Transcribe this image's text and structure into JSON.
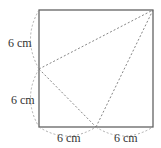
{
  "diagram": {
    "shape": "square",
    "labels": {
      "left_top": "6 cm",
      "left_bottom": "6 cm",
      "bottom_left": "6 cm",
      "bottom_right": "6 cm"
    },
    "colors": {
      "square_stroke": "#555555",
      "dashed_stroke": "#777777",
      "text": "#333333"
    }
  }
}
